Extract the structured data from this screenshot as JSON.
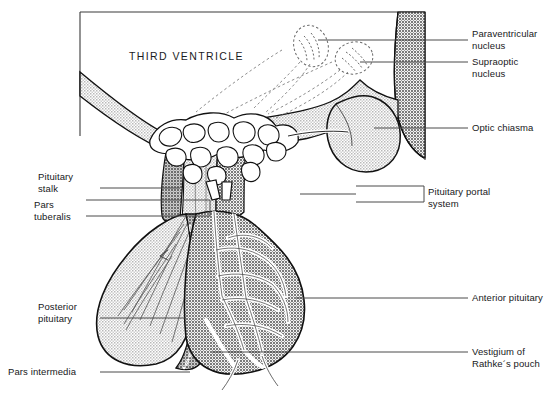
{
  "figure": {
    "title_in_image": "THIRD VENTRICLE",
    "width": 548,
    "height": 402
  },
  "regions": {
    "third_ventricle": "THIRD VENTRICLE"
  },
  "labels": {
    "paraventricular_nucleus": "Paraventricular\nnucleus",
    "supraoptic_nucleus": "Supraoptic\nnucleus",
    "optic_chiasma": "Optic chiasma",
    "pituitary_portal_system": "Pituitary portal\nsystem",
    "anterior_pituitary": "Anterior pituitary",
    "vestigium_rathkes_pouch": "Vestigium of\nRathke´s pouch",
    "pituitary_stalk": "Pituitary\nstalk",
    "pars_tuberalis": "Pars\ntuberalis",
    "posterior_pituitary": "Posterior\npituitary",
    "pars_intermedia": "Pars intermedia"
  },
  "colors": {
    "ink": "#17181a",
    "outline": "#111111",
    "paper": "#ffffff",
    "tissue_light": "#d8d8d8",
    "tissue_mid": "#c2c2c2",
    "tissue_dark": "#9e9e9e",
    "tissue_darker": "#8c8c8c",
    "leader_line": "#4a4a4a",
    "frame": "#3a3a3a",
    "vessel_white": "#ffffff"
  }
}
